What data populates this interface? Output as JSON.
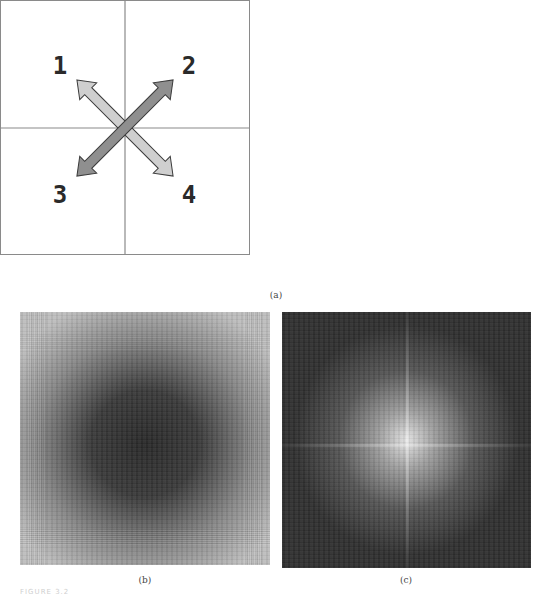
{
  "figure_a": {
    "quadrant_labels": [
      "1",
      "2",
      "3",
      "4"
    ],
    "caption": "(a)",
    "colors": {
      "border": "#8a8a8a",
      "crosshair": "#8a8a8a",
      "arrow_light": "#cfcfcf",
      "arrow_dark": "#8f8f8f",
      "arrow_outline": "#3a3a3a",
      "label": "#2a2a2a"
    },
    "arrows": [
      {
        "name": "diagonal-1-4",
        "from_label": "1",
        "to_label": "4",
        "shade": "light"
      },
      {
        "name": "diagonal-3-2",
        "from_label": "3",
        "to_label": "2",
        "shade": "dark"
      }
    ]
  },
  "figure_b": {
    "caption": "(b)",
    "description": "Spectrum image: bright corners, dark center"
  },
  "figure_c": {
    "caption": "(c)",
    "description": "Spectrum image: dark corners, bright central cross"
  },
  "footer": {
    "text": "FIGURE 3.2"
  }
}
